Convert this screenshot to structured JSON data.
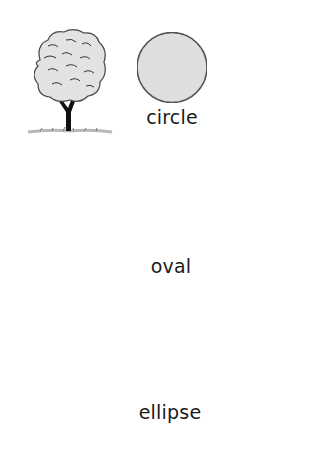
{
  "rows": [
    {
      "label": "circle",
      "shape": {
        "type": "circle",
        "fill": "#e2e2e2",
        "stroke": "#3a3a3a"
      },
      "leafy_tree": {
        "crown_shape": "circle",
        "fill": "#e6e6e6"
      },
      "bare_tree": {
        "crown_shape": "circle"
      }
    },
    {
      "label": "oval",
      "shape": {
        "type": "oval",
        "fill": "#a8a8a8",
        "stroke": "#2e2e2e"
      },
      "leafy_tree": {
        "crown_shape": "oval",
        "fill": "#b4b4b4"
      },
      "bare_tree": {
        "crown_shape": "oval"
      }
    },
    {
      "label": "ellipse",
      "shape": {
        "type": "ellipse",
        "fill": "#6a6a6a",
        "stroke": "#2a2a2a"
      },
      "leafy_tree": {
        "crown_shape": "ellipse",
        "fill": "#8a8a8a"
      },
      "bare_tree": {
        "crown_shape": "ellipse"
      }
    }
  ]
}
